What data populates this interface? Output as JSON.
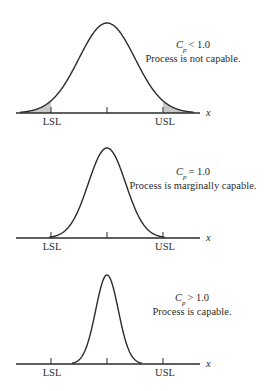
{
  "figure": {
    "axis_label": "x",
    "lower_limit_label": "LSL",
    "upper_limit_label": "USL",
    "colors": {
      "line": "#2b2b2b",
      "shade": "#c8c8c8",
      "background": "#ffffff"
    }
  },
  "panels": [
    {
      "id": "not-capable",
      "cp_symbol": "C",
      "cp_subscript": "p",
      "cp_relation": "< 1.0",
      "description": "Process is not capable.",
      "axis_y": 113,
      "peak_y": 23,
      "center_x": 107,
      "lsl_x": 51,
      "usl_x": 163,
      "sigma_px": 28,
      "shade_tails": true,
      "text_x": 193,
      "cp_y": 48,
      "desc_y": 62
    },
    {
      "id": "marginally-capable",
      "cp_symbol": "C",
      "cp_subscript": "p",
      "cp_relation": "= 1.0",
      "description": "Process is marginally capable.",
      "axis_y": 238,
      "peak_y": 148,
      "center_x": 107,
      "lsl_x": 51,
      "usl_x": 163,
      "sigma_px": 18.7,
      "shade_tails": false,
      "text_x": 193,
      "cp_y": 175,
      "desc_y": 189
    },
    {
      "id": "capable",
      "cp_symbol": "C",
      "cp_subscript": "p",
      "cp_relation": "> 1.0",
      "description": "Process is capable.",
      "axis_y": 364,
      "peak_y": 275,
      "center_x": 107,
      "lsl_x": 51,
      "usl_x": 163,
      "sigma_px": 11.3,
      "shade_tails": false,
      "text_x": 192,
      "cp_y": 301,
      "desc_y": 315
    }
  ]
}
